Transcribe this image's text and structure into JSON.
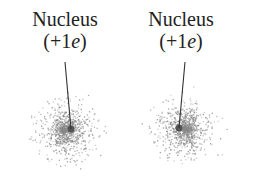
{
  "atoms": [
    {
      "label": "Nucleus",
      "charge_prefix": "(+1",
      "charge_unit": "e",
      "charge_suffix": ")",
      "nucleus": [
        71,
        129
      ],
      "cloud_center": [
        64,
        130
      ],
      "skew": -1
    },
    {
      "label": "Nucleus",
      "charge_prefix": "(+1",
      "charge_unit": "e",
      "charge_suffix": ")",
      "nucleus": [
        179,
        128
      ],
      "cloud_center": [
        186,
        129
      ],
      "skew": 1
    }
  ],
  "colors": {
    "cloud": "#8a8a8a",
    "nucleus": "#555555",
    "text": "#222222"
  }
}
